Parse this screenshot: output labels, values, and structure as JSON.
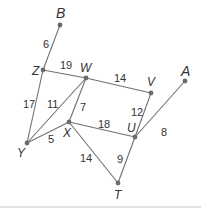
{
  "diagram": {
    "type": "weighted-graph",
    "colors": {
      "edge": "#707070",
      "node": "#6a6a6a",
      "text": "#333333",
      "baseline": "#d8d8d8"
    },
    "vertices": [
      {
        "id": "B",
        "label": "B",
        "x": 60,
        "y": 25,
        "lx": 56,
        "ly": 18,
        "big": true
      },
      {
        "id": "Z",
        "label": "Z",
        "x": 43,
        "y": 70,
        "lx": 32,
        "ly": 75,
        "big": false
      },
      {
        "id": "W",
        "label": "W",
        "x": 86,
        "y": 78,
        "lx": 80,
        "ly": 72,
        "big": false
      },
      {
        "id": "V",
        "label": "V",
        "x": 151,
        "y": 93,
        "lx": 147,
        "ly": 86,
        "big": false
      },
      {
        "id": "A",
        "label": "A",
        "x": 185,
        "y": 81,
        "lx": 181,
        "ly": 76,
        "big": true
      },
      {
        "id": "X",
        "label": "X",
        "x": 69,
        "y": 122,
        "lx": 63,
        "ly": 137,
        "big": false
      },
      {
        "id": "U",
        "label": "U",
        "x": 135,
        "y": 137,
        "lx": 127,
        "ly": 132,
        "big": false
      },
      {
        "id": "Y",
        "label": "Y",
        "x": 27,
        "y": 143,
        "lx": 17,
        "ly": 157,
        "big": false
      },
      {
        "id": "T",
        "label": "T",
        "x": 118,
        "y": 183,
        "lx": 114,
        "ly": 199,
        "big": false
      }
    ],
    "edges": [
      {
        "from": "B",
        "to": "Z",
        "weight": "6",
        "lx": 43,
        "ly": 48
      },
      {
        "from": "Z",
        "to": "W",
        "weight": "19",
        "lx": 60,
        "ly": 69
      },
      {
        "from": "W",
        "to": "V",
        "weight": "14",
        "lx": 114,
        "ly": 82
      },
      {
        "from": "Z",
        "to": "Y",
        "weight": "17",
        "lx": 23,
        "ly": 108
      },
      {
        "from": "W",
        "to": "Y",
        "weight": "11",
        "lx": 47,
        "ly": 108
      },
      {
        "from": "W",
        "to": "X",
        "weight": "7",
        "lx": 80,
        "ly": 111
      },
      {
        "from": "Y",
        "to": "X",
        "weight": "5",
        "lx": 48,
        "ly": 143
      },
      {
        "from": "X",
        "to": "U",
        "weight": "18",
        "lx": 98,
        "ly": 128
      },
      {
        "from": "V",
        "to": "U",
        "weight": "12",
        "lx": 131,
        "ly": 116
      },
      {
        "from": "U",
        "to": "A",
        "weight": "8",
        "lx": 161,
        "ly": 136
      },
      {
        "from": "X",
        "to": "T",
        "weight": "14",
        "lx": 80,
        "ly": 162
      },
      {
        "from": "U",
        "to": "T",
        "weight": "9",
        "lx": 117,
        "ly": 163
      }
    ]
  }
}
